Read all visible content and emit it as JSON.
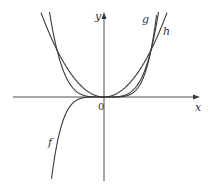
{
  "figure": {
    "axes": {
      "x_label": "x",
      "y_label": "y",
      "origin_label": "0"
    },
    "curves": [
      {
        "name": "f",
        "label": "f",
        "expr": "x^5"
      },
      {
        "name": "g",
        "label": "g",
        "expr": "x^4"
      },
      {
        "name": "h",
        "label": "h",
        "expr": "x^2"
      }
    ],
    "colors": {
      "stroke": "#3a3a3a",
      "background": "#ffffff"
    }
  }
}
